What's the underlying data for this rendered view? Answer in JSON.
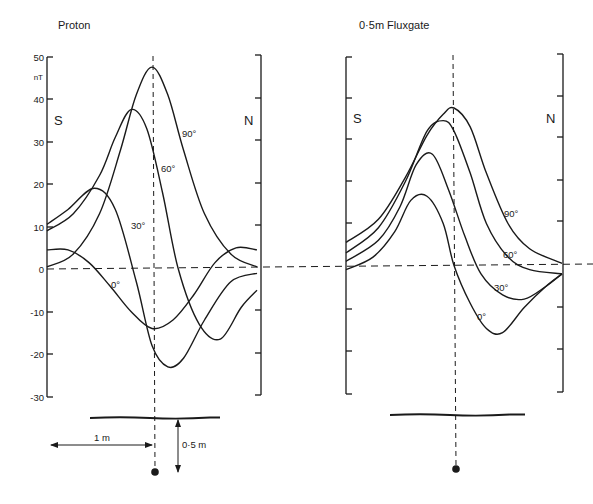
{
  "figure": {
    "background": "#ffffff",
    "ink": "#1a1a1a"
  },
  "chart_data": [
    {
      "type": "line",
      "title": "Proton",
      "ylabel": "nT",
      "xlabel": "distance along traverse (m), 0 = above source",
      "ylim": [
        -30,
        50
      ],
      "yticks": [
        50,
        40,
        30,
        20,
        10,
        0,
        -10,
        -20,
        -30
      ],
      "ytick_labels": [
        "50",
        "40",
        "30",
        "20",
        "10",
        "0",
        "-10",
        "-20",
        "-30"
      ],
      "left_side_label": "S",
      "right_side_label": "N",
      "grid": false,
      "legend": "inline curve labels",
      "series": [
        {
          "name": "90°",
          "label": "90°",
          "x": [
            -1.0,
            -0.75,
            -0.5,
            -0.3,
            -0.15,
            0.0,
            0.15,
            0.3,
            0.5,
            0.75,
            1.0
          ],
          "values": [
            0.5,
            3.5,
            13,
            28,
            41,
            47.5,
            41,
            28,
            13,
            3.5,
            0.5
          ]
        },
        {
          "name": "60°",
          "label": "60°",
          "x": [
            -1.0,
            -0.75,
            -0.5,
            -0.35,
            -0.2,
            -0.05,
            0.1,
            0.25,
            0.45,
            0.65,
            0.85,
            1.0
          ],
          "values": [
            9,
            13,
            22,
            31,
            37.5,
            33,
            18,
            0,
            -13,
            -16.5,
            -9,
            -5
          ]
        },
        {
          "name": "30°",
          "label": "30°",
          "x": [
            -1.0,
            -0.8,
            -0.55,
            -0.35,
            -0.15,
            0.0,
            0.15,
            0.3,
            0.5,
            0.75,
            1.0
          ],
          "values": [
            10.5,
            14,
            19,
            14,
            -3,
            -18,
            -23,
            -21,
            -12,
            -3,
            -1
          ]
        },
        {
          "name": "0°",
          "label": "0°",
          "x": [
            -1.0,
            -0.8,
            -0.6,
            -0.4,
            -0.2,
            0.0,
            0.2,
            0.4,
            0.6,
            0.8,
            1.0
          ],
          "values": [
            4.5,
            4.5,
            1.5,
            -4,
            -10,
            -14,
            -12,
            -6,
            1.5,
            5,
            4.5
          ]
        }
      ],
      "annotations": {
        "profile_line": "horizontal ground surface",
        "horizontal_arrow": "1m",
        "vertical_arrow": "0·5m",
        "source_marker": "dipole source below centre"
      }
    },
    {
      "type": "line",
      "title": "0·5m Fluxgate",
      "ylabel": "nT (same scale as Proton)",
      "xlabel": "distance along traverse (m), 0 = above source",
      "ylim": [
        -30,
        50
      ],
      "left_side_label": "S",
      "right_side_label": "N",
      "grid": false,
      "legend": "inline curve labels",
      "series": [
        {
          "name": "90°",
          "label": "90°",
          "x": [
            -1.0,
            -0.7,
            -0.45,
            -0.25,
            -0.1,
            0.0,
            0.15,
            0.3,
            0.5,
            0.7,
            1.0
          ],
          "values": [
            5.5,
            11,
            21,
            31,
            36,
            37.5,
            33,
            22,
            10,
            4,
            0.5
          ]
        },
        {
          "name": "60°",
          "label": "60°",
          "x": [
            -1.0,
            -0.7,
            -0.45,
            -0.25,
            -0.1,
            0.0,
            0.15,
            0.3,
            0.5,
            0.7,
            1.0
          ],
          "values": [
            3,
            9,
            20,
            32,
            34.5,
            32,
            22,
            10,
            2,
            -1,
            -2
          ]
        },
        {
          "name": "30°",
          "label": "30°",
          "x": [
            -1.0,
            -0.7,
            -0.5,
            -0.35,
            -0.2,
            -0.05,
            0.1,
            0.25,
            0.45,
            0.65,
            0.85,
            1.0
          ],
          "values": [
            1,
            6,
            14,
            24,
            26.5,
            18,
            7,
            -2,
            -7,
            -8,
            -5,
            -2
          ]
        },
        {
          "name": "0°",
          "label": "0°",
          "x": [
            -1.0,
            -0.75,
            -0.55,
            -0.4,
            -0.25,
            -0.1,
            0.0,
            0.15,
            0.3,
            0.45,
            0.65,
            0.85,
            1.0
          ],
          "values": [
            -1,
            2,
            8,
            15.5,
            16.5,
            10,
            0,
            -9,
            -15,
            -16,
            -10,
            -5,
            -2
          ]
        }
      ],
      "annotations": {
        "profile_line": "horizontal ground surface",
        "source_marker": "dipole source below centre"
      }
    }
  ],
  "panels": {
    "left": {
      "title": "Proton",
      "unit": "nT",
      "s_label": "S",
      "n_label": "N",
      "tick_labels": [
        "50",
        "40",
        "30",
        "20",
        "10",
        "0",
        "-10",
        "-20",
        "-30"
      ],
      "curve_labels": [
        "90°",
        "60°",
        "30°",
        "0°"
      ],
      "dim_horizontal": "1 m",
      "dim_vertical": "0·5 m"
    },
    "right": {
      "title": "0·5m Fluxgate",
      "s_label": "S",
      "n_label": "N",
      "curve_labels": [
        "90°",
        "60°",
        "30°",
        "0°"
      ]
    }
  }
}
